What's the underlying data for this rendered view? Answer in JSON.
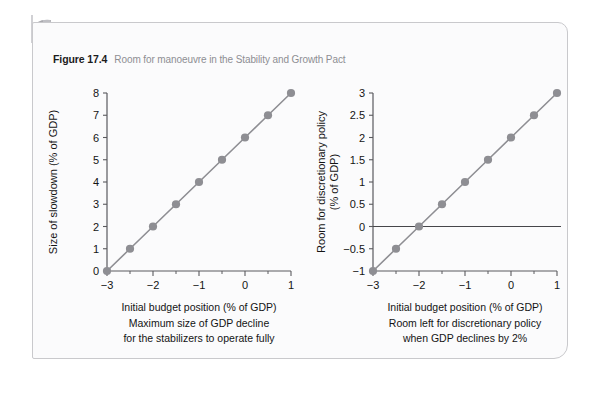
{
  "figure": {
    "number": "Figure 17.4",
    "caption": "Room for manoeuvre in the Stability and Growth Pact"
  },
  "style": {
    "series_color": "#8e8e93",
    "axis_color": "#5a5a5e",
    "panel_bg": "#fbfbfc",
    "page_bg": "#ffffff",
    "caption_color": "#8e8e93",
    "text_color": "#141414"
  },
  "chart_data": [
    {
      "type": "line",
      "id": "max-size-of-gdp-decline",
      "title": "",
      "xlabel": "Initial budget position (% of GDP)",
      "ylabel": "Size of slowdown (% of GDP)",
      "ylabel_lines": [
        "Size of slowdown (% of GDP)"
      ],
      "caption_lines": [
        "Initial budget position (% of GDP)",
        "Maximum size of GDP decline",
        "for the stabilizers to operate fully"
      ],
      "x": [
        -3,
        -2.5,
        -2,
        -1.5,
        -1,
        -0.5,
        0,
        0.5,
        1
      ],
      "values": [
        0,
        1,
        2,
        3,
        4,
        5,
        6,
        7,
        8
      ],
      "xlim": [
        -3,
        1
      ],
      "ylim": [
        0,
        8
      ],
      "xticks": [
        -3,
        -2,
        -1,
        0,
        1
      ],
      "xtick_labels": [
        "−3",
        "−2",
        "−1",
        "0",
        "1"
      ],
      "xminor_ticks": [
        -2.5,
        -1.5,
        -0.5,
        0.5
      ],
      "yticks": [
        0,
        1,
        2,
        3,
        4,
        5,
        6,
        7,
        8
      ],
      "ytick_labels": [
        "0",
        "1",
        "2",
        "3",
        "4",
        "5",
        "6",
        "7",
        "8"
      ],
      "zero_line": false,
      "grid": false,
      "legend": "none",
      "marker": "circle"
    },
    {
      "type": "line",
      "id": "room-left-for-discretionary-policy",
      "title": "",
      "xlabel": "Initial budget position (% of GDP)",
      "ylabel": "Room for discretionary policy (% of GDP)",
      "ylabel_lines": [
        "Room for discretionary policy",
        "(% of GDP)"
      ],
      "caption_lines": [
        "Initial budget position (% of GDP)",
        "Room left for discretionary policy",
        "when GDP declines by 2%"
      ],
      "x": [
        -3,
        -2.5,
        -2,
        -1.5,
        -1,
        -0.5,
        0,
        0.5,
        1
      ],
      "values": [
        -1,
        -0.5,
        0,
        0.5,
        1,
        1.5,
        2,
        2.5,
        3
      ],
      "xlim": [
        -3,
        1
      ],
      "ylim": [
        -1,
        3
      ],
      "xticks": [
        -3,
        -2,
        -1,
        0,
        1
      ],
      "xtick_labels": [
        "−3",
        "−2",
        "−1",
        "0",
        "1"
      ],
      "xminor_ticks": [
        -2.5,
        -1.5,
        -0.5,
        0.5
      ],
      "yticks": [
        -1,
        -0.5,
        0,
        0.5,
        1,
        1.5,
        2,
        2.5,
        3
      ],
      "ytick_labels": [
        "−1",
        "−0.5",
        "0",
        "0.5",
        "1",
        "1.5",
        "2",
        "2.5",
        "3"
      ],
      "zero_line": true,
      "zero_line_value": 0,
      "grid": false,
      "legend": "none",
      "marker": "circle"
    }
  ]
}
